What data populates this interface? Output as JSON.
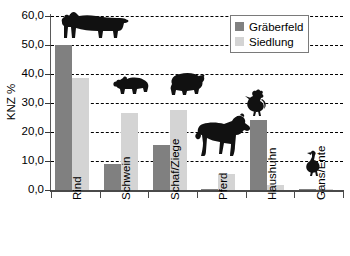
{
  "chart_data": {
    "type": "bar",
    "title": "",
    "xlabel": "",
    "ylabel": "KNZ %",
    "ylim": [
      0,
      60
    ],
    "ytick_values": [
      0,
      10,
      20,
      30,
      40,
      50,
      60
    ],
    "ytick_labels": [
      "0,0",
      "10,0",
      "20,0",
      "30,0",
      "40,0",
      "50,0",
      "60,0"
    ],
    "grid": true,
    "grid_style": "dashed-horizontal",
    "legend_position": "top-right",
    "categories": [
      "Rind",
      "Schwein",
      "Schaf/Ziege",
      "Pferd",
      "Haushuhn",
      "Gans/Ente"
    ],
    "series": [
      {
        "name": "Gräberfeld",
        "color": "#808080",
        "values": [
          50.0,
          9.0,
          15.5,
          0.5,
          24.3,
          0.3
        ]
      },
      {
        "name": "Siedlung",
        "color": "#d4d4d4",
        "values": [
          38.5,
          26.7,
          27.5,
          5.5,
          1.8,
          0.3
        ]
      }
    ],
    "annotations": [
      {
        "name": "cow-silhouette",
        "category": "Rind"
      },
      {
        "name": "pig-silhouette",
        "category": "Schwein"
      },
      {
        "name": "sheep-silhouette",
        "category": "Schaf/Ziege"
      },
      {
        "name": "horse-silhouette",
        "category": "Pferd"
      },
      {
        "name": "rooster-silhouette",
        "category": "Haushuhn"
      },
      {
        "name": "goose-silhouette",
        "category": "Gans/Ente"
      }
    ]
  },
  "legend": {
    "items": [
      {
        "label": "Gräberfeld",
        "color": "#808080"
      },
      {
        "label": "Siedlung",
        "color": "#d4d4d4"
      }
    ]
  },
  "axis": {
    "y_label": "KNZ %",
    "y_ticks": [
      "60,0",
      "50,0",
      "40,0",
      "30,0",
      "20,0",
      "10,0",
      "0,0"
    ],
    "x_categories": [
      "Rind",
      "Schwein",
      "Schaf/Ziege",
      "Pferd",
      "Haushuhn",
      "Gans/Ente"
    ]
  }
}
